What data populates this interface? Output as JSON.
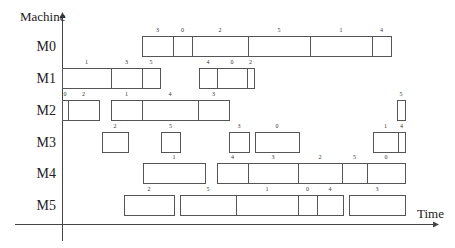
{
  "chart_data": {
    "type": "gantt",
    "title": "",
    "xlabel": "Time",
    "ylabel": "Machine",
    "grid": false,
    "legend": null,
    "machines": [
      "M0",
      "M1",
      "M2",
      "M3",
      "M4",
      "M5"
    ],
    "tasks": [
      {
        "machine": "M0",
        "job": "3",
        "start": 142,
        "end": 173
      },
      {
        "machine": "M0",
        "job": "0",
        "start": 173,
        "end": 192
      },
      {
        "machine": "M0",
        "job": "2",
        "start": 192,
        "end": 248
      },
      {
        "machine": "M0",
        "job": "5",
        "start": 248,
        "end": 310
      },
      {
        "machine": "M0",
        "job": "1",
        "start": 310,
        "end": 372
      },
      {
        "machine": "M0",
        "job": "4",
        "start": 372,
        "end": 391
      },
      {
        "machine": "M1",
        "job": "1",
        "start": 62,
        "end": 111
      },
      {
        "machine": "M1",
        "job": "3",
        "start": 111,
        "end": 142
      },
      {
        "machine": "M1",
        "job": "5",
        "start": 142,
        "end": 160
      },
      {
        "machine": "M1",
        "job": "4",
        "start": 199,
        "end": 217
      },
      {
        "machine": "M1",
        "job": "0",
        "start": 217,
        "end": 247
      },
      {
        "machine": "M1",
        "job": "2",
        "start": 247,
        "end": 254
      },
      {
        "machine": "M2",
        "job": "0",
        "start": 62,
        "end": 68
      },
      {
        "machine": "M2",
        "job": "2",
        "start": 68,
        "end": 99
      },
      {
        "machine": "M2",
        "job": "1",
        "start": 111,
        "end": 142
      },
      {
        "machine": "M2",
        "job": "4",
        "start": 142,
        "end": 198
      },
      {
        "machine": "M2",
        "job": "3",
        "start": 198,
        "end": 229
      },
      {
        "machine": "M2",
        "job": "5",
        "start": 397,
        "end": 405
      },
      {
        "machine": "M3",
        "job": "2",
        "start": 102,
        "end": 128
      },
      {
        "machine": "M3",
        "job": "5",
        "start": 161,
        "end": 180
      },
      {
        "machine": "M3",
        "job": "3",
        "start": 229,
        "end": 249
      },
      {
        "machine": "M3",
        "job": "0",
        "start": 255,
        "end": 299
      },
      {
        "machine": "M3",
        "job": "1",
        "start": 373,
        "end": 398
      },
      {
        "machine": "M3",
        "job": "4",
        "start": 398,
        "end": 405
      },
      {
        "machine": "M4",
        "job": "1",
        "start": 143,
        "end": 205
      },
      {
        "machine": "M4",
        "job": "4",
        "start": 217,
        "end": 248
      },
      {
        "machine": "M4",
        "job": "3",
        "start": 248,
        "end": 298
      },
      {
        "machine": "M4",
        "job": "2",
        "start": 298,
        "end": 342
      },
      {
        "machine": "M4",
        "job": "5",
        "start": 342,
        "end": 367
      },
      {
        "machine": "M4",
        "job": "0",
        "start": 367,
        "end": 405
      },
      {
        "machine": "M5",
        "job": "2",
        "start": 124,
        "end": 174
      },
      {
        "machine": "M5",
        "job": "5",
        "start": 180,
        "end": 236
      },
      {
        "machine": "M5",
        "job": "1",
        "start": 236,
        "end": 298
      },
      {
        "machine": "M5",
        "job": "0",
        "start": 298,
        "end": 317
      },
      {
        "machine": "M5",
        "job": "4",
        "start": 317,
        "end": 343
      },
      {
        "machine": "M5",
        "job": "3",
        "start": 349,
        "end": 405
      }
    ]
  },
  "layout": {
    "y_axis_x": 62,
    "x_axis_y": 224,
    "row_tops": {
      "M0": 36,
      "M1": 68,
      "M2": 100,
      "M3": 132,
      "M4": 163,
      "M5": 195
    },
    "row_height": 21
  },
  "labels": {
    "y_axis": "Machine",
    "x_axis": "Time"
  }
}
